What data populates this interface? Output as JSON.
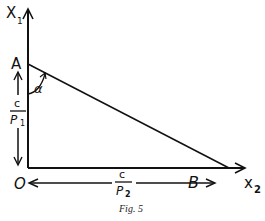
{
  "figure": {
    "caption": "Fig. 5",
    "axes": {
      "vertical_label": "X",
      "vertical_subscript": "1",
      "horizontal_label": "x",
      "horizontal_subscript": "2"
    },
    "points": {
      "origin": "O",
      "a": "A",
      "b": "B"
    },
    "angle_label": "α",
    "vertical_dimension": {
      "numerator": "c",
      "denominator": "P",
      "denominator_subscript": "1"
    },
    "horizontal_dimension": {
      "numerator": "c",
      "denominator": "P",
      "denominator_subscript": "2"
    }
  }
}
